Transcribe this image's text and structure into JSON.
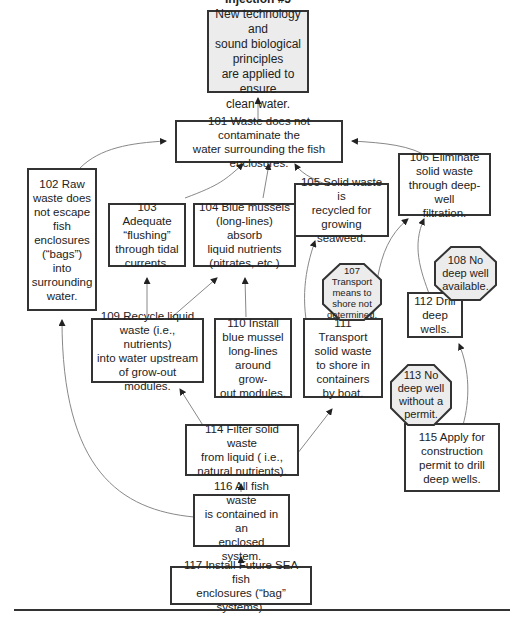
{
  "injection": {
    "title": "Injection #5",
    "text": "New technology and\nsound biological principles\nare applied to ensure\nclean water."
  },
  "nodes": {
    "n101": "101  Waste does not contaminate the\nwater surrounding the fish enclosures.",
    "n102": "102  Raw\nwaste does\nnot escape\nfish\nenclosures\n(“bags”) into\nsurrounding\nwater.",
    "n103": "103  Adequate\n“flushing”\nthrough tidal\ncurrents.",
    "n104": "104  Blue mussels\n(long-lines) absorb\nliquid nutrients\n(nitrates, etc.)",
    "n105": "105 Solid waste is\nrecycled for\ngrowing seaweed.",
    "n106": "106  Eliminate\nsolid waste\nthrough deep-well\nfiltration.",
    "n109": "109  Recycle liquid\nwaste (i.e., nutrients)\ninto water upstream\nof grow-out modules.",
    "n110": "110  Install\nblue mussel\nlong-lines\naround grow-\nout modules.",
    "n111": "111  Transport\nsolid waste\nto shore in\ncontainers\nby boat.",
    "n112": "112  Drill\ndeep wells.",
    "n114": "114  Filter solid waste\nfrom liquid ( i.e.,\nnatural nutrients).",
    "n115": "115  Apply for\nconstruction\npermit to drill\ndeep wells.",
    "n116": "116  All fish waste\nis contained in an\nenclosed system.",
    "n117": "117  Install Future SEA fish\nenclosures (“bag” systems)."
  },
  "obstacles": {
    "o107": "107\nTransport\nmeans to\nshore not\ndetermined.",
    "o108": "108  No\ndeep well\navailable.",
    "o113": "113  No\ndeep well\nwithout a\npermit."
  },
  "colors": {
    "border": "#333333",
    "injection_fill": "#ececec",
    "obstacle_fill": "#ececec",
    "arrow": "#777777"
  }
}
